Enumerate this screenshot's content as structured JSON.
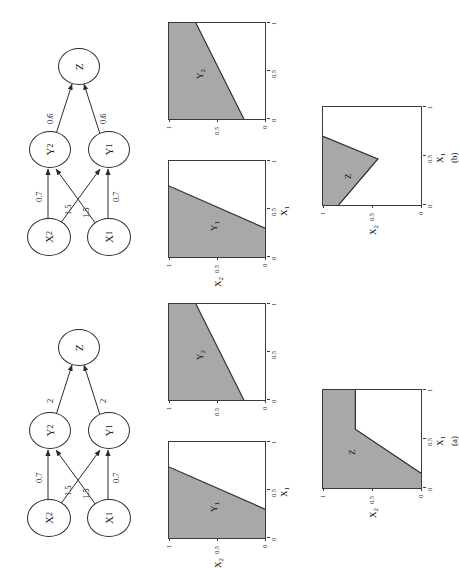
{
  "figure": {
    "caption_panels": [
      "(a)",
      "(b)"
    ],
    "shade_color": "#a8a8a8",
    "line_color": "#2b2b2b",
    "background": "#ffffff"
  },
  "panels": [
    {
      "id": "a",
      "label": "(a)",
      "network": {
        "nodes": [
          {
            "id": "X2",
            "base": "X",
            "sub": "2"
          },
          {
            "id": "X1",
            "base": "X",
            "sub": "1"
          },
          {
            "id": "Y2",
            "base": "Y",
            "sub": "2"
          },
          {
            "id": "Y1",
            "base": "Y",
            "sub": "1"
          },
          {
            "id": "Z",
            "base": "Z",
            "sub": ""
          }
        ],
        "edges": [
          {
            "from": "X2",
            "to": "Y2",
            "weight": "0.7"
          },
          {
            "from": "X2",
            "to": "Y1",
            "weight": "1.5"
          },
          {
            "from": "X1",
            "to": "Y2",
            "weight": "1.5"
          },
          {
            "from": "X1",
            "to": "Y1",
            "weight": "0.7"
          },
          {
            "from": "Y2",
            "to": "Z",
            "weight": "2"
          },
          {
            "from": "Y1",
            "to": "Z",
            "weight": "2"
          }
        ]
      },
      "plots": [
        {
          "name": "Y1",
          "region_label": "Y",
          "region_sub": "1",
          "xlabel_base": "X",
          "xlabel_sub": "1",
          "ylabel_base": "X",
          "ylabel_sub": "2",
          "xticks": [
            "0",
            "0.5",
            "1"
          ],
          "yticks": [
            "0",
            "0.5",
            "1"
          ],
          "xlim": [
            0,
            1
          ],
          "ylim": [
            0,
            1
          ],
          "boundary": [
            [
              0.3,
              0.0
            ],
            [
              0.74,
              1.0
            ]
          ],
          "shaded_side": "upper-left"
        },
        {
          "name": "Y2",
          "region_label": "Y",
          "region_sub": "2",
          "xlabel_base": "X",
          "xlabel_sub": "1",
          "ylabel_base": "",
          "ylabel_sub": "",
          "xticks": [
            "0",
            "0.5",
            "1"
          ],
          "yticks": [
            "0",
            "0.5",
            "1"
          ],
          "xlim": [
            0,
            1
          ],
          "ylim": [
            0,
            1
          ],
          "boundary": [
            [
              0.0,
              0.22
            ],
            [
              1.0,
              0.72
            ]
          ],
          "shaded_side": "upper-left"
        },
        {
          "name": "Z",
          "region_label": "Z",
          "region_sub": "",
          "xlabel_base": "X",
          "xlabel_sub": "1",
          "ylabel_base": "X",
          "ylabel_sub": "2",
          "xticks": [
            "0",
            "0.5",
            "1"
          ],
          "yticks": [
            "0",
            "0.5",
            "1"
          ],
          "xlim": [
            0,
            1
          ],
          "ylim": [
            0,
            1
          ],
          "boundary": [
            [
              0.0,
              1.0
            ],
            [
              0.6,
              0.67
            ],
            [
              0.85,
              0.0
            ],
            [
              1.0,
              0.0
            ]
          ],
          "shaded_side": "upper-left"
        }
      ]
    },
    {
      "id": "b",
      "label": "(b)",
      "network": {
        "nodes": [
          {
            "id": "X2",
            "base": "X",
            "sub": "2"
          },
          {
            "id": "X1",
            "base": "X",
            "sub": "1"
          },
          {
            "id": "Y2",
            "base": "Y",
            "sub": "2"
          },
          {
            "id": "Y1",
            "base": "Y",
            "sub": "1"
          },
          {
            "id": "Z",
            "base": "Z",
            "sub": ""
          }
        ],
        "edges": [
          {
            "from": "X2",
            "to": "Y2",
            "weight": "0.7"
          },
          {
            "from": "X2",
            "to": "Y1",
            "weight": "1.5"
          },
          {
            "from": "X1",
            "to": "Y2",
            "weight": "1.5"
          },
          {
            "from": "X1",
            "to": "Y1",
            "weight": "0.7"
          },
          {
            "from": "Y2",
            "to": "Z",
            "weight": "0.6"
          },
          {
            "from": "Y1",
            "to": "Z",
            "weight": "0.6"
          }
        ]
      },
      "plots": [
        {
          "name": "Y1",
          "region_label": "Y",
          "region_sub": "1",
          "xlabel_base": "X",
          "xlabel_sub": "1",
          "ylabel_base": "X",
          "ylabel_sub": "2",
          "xticks": [
            "0",
            "0.5",
            "1"
          ],
          "yticks": [
            "0",
            "0.5",
            "1"
          ],
          "xlim": [
            0,
            1
          ],
          "ylim": [
            0,
            1
          ],
          "boundary": [
            [
              0.3,
              0.0
            ],
            [
              0.74,
              1.0
            ]
          ],
          "shaded_side": "upper-left"
        },
        {
          "name": "Y2",
          "region_label": "Y",
          "region_sub": "2",
          "xlabel_base": "",
          "xlabel_sub": "",
          "ylabel_base": "",
          "ylabel_sub": "",
          "xticks": [
            "0",
            "0.5",
            "1"
          ],
          "yticks": [
            "0",
            "0.5",
            "1"
          ],
          "xlim": [
            0,
            1
          ],
          "ylim": [
            0,
            1
          ],
          "boundary": [
            [
              0.0,
              0.22
            ],
            [
              1.0,
              0.72
            ]
          ],
          "shaded_side": "upper-left"
        },
        {
          "name": "Z",
          "region_label": "Z",
          "region_sub": "",
          "xlabel_base": "X",
          "xlabel_sub": "1",
          "ylabel_base": "X",
          "ylabel_sub": "2",
          "xticks": [
            "0",
            "0.5",
            "1"
          ],
          "yticks": [
            "0",
            "0.5",
            "1"
          ],
          "xlim": [
            0,
            1
          ],
          "ylim": [
            0,
            1
          ],
          "boundary": [
            [
              0.0,
              0.84
            ],
            [
              0.47,
              0.44
            ],
            [
              0.7,
              0.0
            ],
            [
              1.0,
              0.0
            ]
          ],
          "shaded_side": "upper-left"
        }
      ]
    }
  ]
}
